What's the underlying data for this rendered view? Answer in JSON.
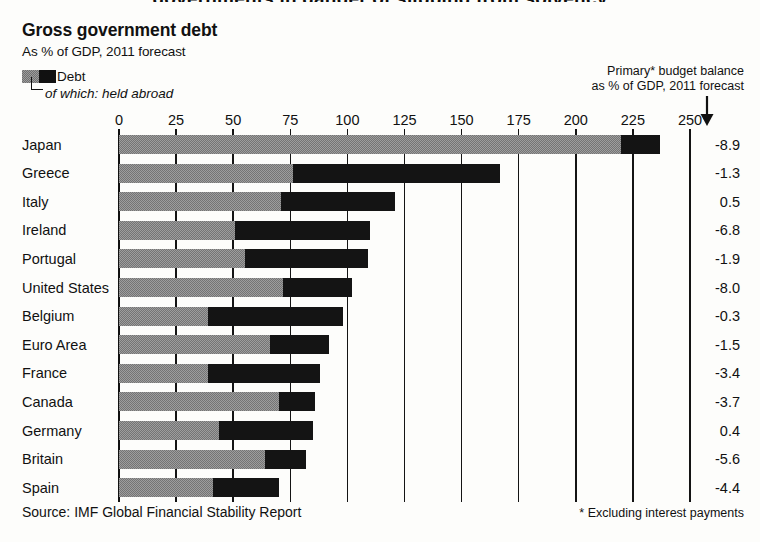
{
  "clipped_top_title": "governments in danger of slipping from solvency",
  "header": {
    "title": "Gross government debt",
    "subtitle": "As % of GDP, 2011 forecast"
  },
  "legend": {
    "debt_label": "Debt",
    "held_abroad_label": "of which: held abroad",
    "gray_color": "#9d9d9d",
    "black_color": "#141414"
  },
  "right_header": {
    "line1": "Primary* budget balance",
    "line2": "as % of GDP, 2011 forecast",
    "arrow_icon": "down-arrow-icon"
  },
  "footer": {
    "source": "Source: IMF Global Financial Stability Report",
    "footnote": "* Excluding interest payments"
  },
  "chart_data": {
    "type": "bar",
    "orientation": "horizontal",
    "title": "Gross government debt",
    "subtitle": "As % of GDP, 2011 forecast",
    "xlabel": "",
    "ylabel": "",
    "xlim": [
      0,
      250
    ],
    "xticks": [
      0,
      25,
      50,
      75,
      100,
      125,
      150,
      175,
      200,
      225,
      250
    ],
    "grid": true,
    "legend_position": "top-left",
    "categories": [
      "Japan",
      "Greece",
      "Italy",
      "Ireland",
      "Portugal",
      "United States",
      "Belgium",
      "Euro Area",
      "France",
      "Canada",
      "Germany",
      "Britain",
      "Spain"
    ],
    "series": [
      {
        "name": "Debt",
        "values": [
          237,
          167,
          121,
          110,
          109,
          102,
          98,
          92,
          88,
          86,
          85,
          82,
          70
        ]
      },
      {
        "name": "of which: held abroad",
        "start_values": [
          220,
          76,
          71,
          51,
          55,
          72,
          39,
          66,
          39,
          70,
          44,
          64,
          41
        ],
        "values": [
          17,
          91,
          50,
          59,
          54,
          30,
          59,
          26,
          49,
          16,
          41,
          18,
          29
        ]
      }
    ],
    "annotations": {
      "column_title": "Primary* budget balance as % of GDP, 2011 forecast",
      "values": [
        "-8.9",
        "-1.3",
        "0.5",
        "-6.8",
        "-1.9",
        "-8.0",
        "-0.3",
        "-1.5",
        "-3.4",
        "-3.7",
        "0.4",
        "-5.6",
        "-4.4"
      ]
    }
  }
}
